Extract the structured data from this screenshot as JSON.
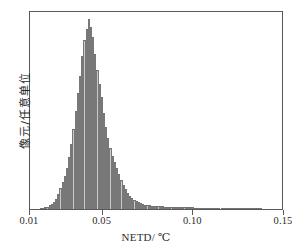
{
  "chart_data": {
    "type": "bar",
    "title": "",
    "subtitle": "",
    "xlabel": "NETD/ ℃",
    "ylabel": "像元/任意单位",
    "xlim": [
      0.01,
      0.15
    ],
    "ylim": [
      0,
      100
    ],
    "xticks": [
      0.01,
      0.05,
      0.1,
      0.15
    ],
    "xticklabels": [
      "0.01",
      "0.05",
      "0.10",
      "0.15"
    ],
    "yticks": [],
    "yticklabels": [],
    "grid": false,
    "legend": null,
    "bin_width": 0.0012,
    "bar_fill": "#c9c9c9",
    "bar_edge": "#787878",
    "frame_color": "#5a5a5a",
    "note": "Histogram of NETD values, arbitrary-unit pixel counts; peak near 0.043 degC with long right tail out to ~0.137 degC",
    "categories": [
      0.016,
      0.0172,
      0.0184,
      0.0196,
      0.0208,
      0.022,
      0.0232,
      0.0244,
      0.0256,
      0.0268,
      0.028,
      0.0292,
      0.0304,
      0.0316,
      0.0328,
      0.034,
      0.0352,
      0.0364,
      0.0376,
      0.0388,
      0.04,
      0.0412,
      0.0424,
      0.0436,
      0.0448,
      0.046,
      0.0472,
      0.0484,
      0.0496,
      0.0508,
      0.052,
      0.0532,
      0.0544,
      0.0556,
      0.0568,
      0.058,
      0.0592,
      0.0604,
      0.0616,
      0.0628,
      0.064,
      0.0652,
      0.0664,
      0.0676,
      0.0688,
      0.07,
      0.0712,
      0.0724,
      0.0736,
      0.0748,
      0.076,
      0.0772,
      0.0784,
      0.0796,
      0.0808,
      0.082,
      0.0832,
      0.0844,
      0.0856,
      0.0868,
      0.088,
      0.0892,
      0.0904,
      0.0916,
      0.0928,
      0.094,
      0.0952,
      0.0964,
      0.0976,
      0.0988,
      0.1,
      0.1012,
      0.1024,
      0.1036,
      0.1048,
      0.106,
      0.1072,
      0.1084,
      0.1096,
      0.1108,
      0.112,
      0.1132,
      0.1144,
      0.1156,
      0.1168,
      0.118,
      0.1192,
      0.1204,
      0.1216,
      0.1228,
      0.124,
      0.1252,
      0.1264,
      0.1276,
      0.1288,
      0.13,
      0.1312,
      0.1324,
      0.1336,
      0.1348,
      0.136,
      0.1372
    ],
    "values": [
      0.4,
      0.6,
      0.8,
      1.2,
      1.8,
      2.6,
      3.6,
      5.0,
      7.5,
      10.5,
      14.0,
      17.0,
      21.0,
      26.5,
      33.0,
      41.0,
      50.0,
      59.0,
      68.0,
      78.0,
      86.0,
      92.0,
      97.0,
      93.0,
      88.0,
      79.0,
      71.0,
      64.0,
      57.0,
      49.0,
      42.0,
      36.0,
      31.0,
      27.0,
      24.0,
      21.0,
      18.0,
      15.0,
      12.5,
      10.0,
      8.0,
      6.5,
      5.4,
      4.6,
      4.0,
      3.4,
      3.0,
      2.6,
      2.3,
      2.1,
      1.9,
      1.7,
      1.6,
      1.5,
      1.4,
      1.3,
      1.3,
      1.2,
      1.2,
      1.1,
      1.1,
      1.0,
      1.0,
      1.0,
      0.9,
      0.9,
      0.9,
      0.8,
      0.8,
      0.8,
      0.8,
      0.7,
      0.7,
      0.7,
      0.7,
      0.6,
      0.6,
      0.6,
      0.6,
      0.6,
      0.5,
      0.5,
      0.5,
      0.5,
      0.5,
      0.4,
      0.4,
      0.4,
      0.4,
      0.4,
      0.4,
      0.3,
      0.3,
      0.3,
      0.3,
      0.3,
      0.3,
      0.3,
      0.2,
      0.2,
      0.2,
      0.2
    ]
  }
}
